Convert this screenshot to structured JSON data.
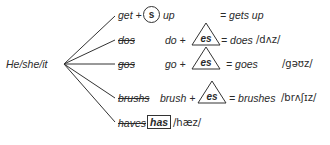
{
  "subject": "He/she/it",
  "rows": [
    {
      "base": "get +",
      "suffix": "s",
      "suffix_shape": "circle",
      "after": "up",
      "result": "= gets up"
    },
    {
      "wrong": "dos",
      "base": "do +",
      "suffix": "es",
      "suffix_shape": "triangle",
      "result": "= does",
      "ipa": "/dʌz/"
    },
    {
      "wrong": "gos",
      "base": "go +",
      "suffix": "es",
      "suffix_shape": "triangle",
      "result": "= goes",
      "ipa": "/gəʊz/"
    },
    {
      "wrong": "brushs",
      "base": "brush +",
      "suffix": "es",
      "suffix_shape": "triangle",
      "result": "= brushes",
      "ipa": "/brʌʃɪz/"
    },
    {
      "wrong": "haves",
      "correct": "has",
      "ipa": "/hæz/"
    }
  ]
}
